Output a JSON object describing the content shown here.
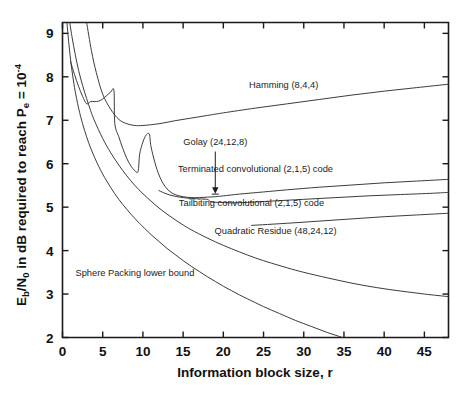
{
  "chart_data": {
    "type": "line",
    "title": "",
    "xlabel": "Information block size, r",
    "ylabel": "Eb/N0 in dB required to reach Pe = 10^-4",
    "ylabel_parts": {
      "p1": "E",
      "sub1": "b",
      "p2": "/N",
      "sub2": "0",
      "p3": " in dB required to reach P",
      "sub3": "e",
      "p4": " = 10",
      "sup1": "-4"
    },
    "xlim": [
      0,
      48
    ],
    "ylim": [
      2,
      9.25
    ],
    "xticks": [
      0,
      5,
      10,
      15,
      20,
      25,
      30,
      35,
      40,
      45
    ],
    "yticks": [
      2,
      3,
      4,
      5,
      6,
      7,
      8,
      9
    ],
    "xticklabels": [
      "0",
      "5",
      "10",
      "15",
      "20",
      "25",
      "30",
      "35",
      "40",
      "45"
    ],
    "yticklabels": [
      "2",
      "3",
      "4",
      "5",
      "6",
      "7",
      "8",
      "9"
    ],
    "grid": false,
    "legend_position": "inline-annotations",
    "line_color": "#33322f",
    "series": [
      {
        "name": "Hamming (8,4,4)",
        "label": "Hamming (8,4,4)",
        "label_xy": [
          27.5,
          7.75
        ],
        "points": [
          [
            3.0,
            9.25
          ],
          [
            3.6,
            8.6
          ],
          [
            4.2,
            8.1
          ],
          [
            5.0,
            7.6
          ],
          [
            6.0,
            7.25
          ],
          [
            7.0,
            7.02
          ],
          [
            8.0,
            6.92
          ],
          [
            9.0,
            6.88
          ],
          [
            10.0,
            6.88
          ],
          [
            12.0,
            6.92
          ],
          [
            14.0,
            6.99
          ],
          [
            16.0,
            7.05
          ],
          [
            18.0,
            7.11
          ],
          [
            20.0,
            7.17
          ],
          [
            24.0,
            7.28
          ],
          [
            28.0,
            7.38
          ],
          [
            32.0,
            7.48
          ],
          [
            36.0,
            7.58
          ],
          [
            40.0,
            7.67
          ],
          [
            44.0,
            7.75
          ],
          [
            48.0,
            7.83
          ]
        ]
      },
      {
        "name": "Terminated convolutional (2,1,5) code",
        "label": "Terminated convolutional (2,1,5) code",
        "label_xy": [
          24.0,
          5.82
        ],
        "points": [
          [
            1.0,
            8.35
          ],
          [
            1.5,
            8.05
          ],
          [
            2.0,
            7.78
          ],
          [
            2.5,
            7.55
          ],
          [
            3.0,
            7.38
          ],
          [
            3.5,
            7.43
          ],
          [
            4.0,
            7.43
          ],
          [
            4.5,
            7.44
          ],
          [
            5.0,
            7.49
          ],
          [
            5.5,
            7.57
          ],
          [
            6.0,
            7.65
          ],
          [
            6.4,
            7.68
          ],
          [
            6.5,
            6.93
          ],
          [
            7.0,
            6.62
          ],
          [
            7.5,
            6.35
          ],
          [
            8.0,
            6.12
          ],
          [
            8.5,
            5.95
          ],
          [
            9.0,
            5.84
          ],
          [
            9.4,
            5.82
          ],
          [
            9.6,
            6.22
          ],
          [
            10.0,
            6.5
          ],
          [
            10.4,
            6.66
          ],
          [
            10.8,
            6.68
          ],
          [
            11.0,
            6.4
          ],
          [
            11.5,
            6.02
          ],
          [
            12.0,
            5.74
          ],
          [
            12.5,
            5.55
          ],
          [
            13.0,
            5.42
          ],
          [
            13.5,
            5.34
          ],
          [
            14.0,
            5.29
          ],
          [
            15.0,
            5.24
          ],
          [
            16.0,
            5.22
          ],
          [
            17.0,
            5.22
          ],
          [
            18.0,
            5.23
          ],
          [
            19.0,
            5.24
          ],
          [
            20.0,
            5.26
          ],
          [
            22.0,
            5.3
          ],
          [
            25.0,
            5.35
          ],
          [
            28.0,
            5.4
          ],
          [
            32.0,
            5.46
          ],
          [
            36.0,
            5.51
          ],
          [
            40.0,
            5.56
          ],
          [
            44.0,
            5.6
          ],
          [
            48.0,
            5.64
          ]
        ]
      },
      {
        "name": "Tailbiting convolutional (2,1,5) code",
        "label": "Tailbiting convolutional (2,1,5) code",
        "label_xy": [
          23.5,
          5.02
        ],
        "points": [
          [
            12.0,
            5.38
          ],
          [
            13.0,
            5.3
          ],
          [
            14.0,
            5.25
          ],
          [
            15.0,
            5.22
          ],
          [
            16.0,
            5.2
          ],
          [
            17.0,
            5.19
          ],
          [
            18.0,
            5.18
          ],
          [
            18.5,
            5.12
          ],
          [
            19.5,
            5.11
          ],
          [
            21.0,
            5.1
          ],
          [
            23.0,
            5.11
          ],
          [
            26.0,
            5.14
          ],
          [
            30.0,
            5.18
          ],
          [
            34.0,
            5.22
          ],
          [
            38.0,
            5.26
          ],
          [
            42.0,
            5.29
          ],
          [
            46.0,
            5.32
          ],
          [
            48.0,
            5.34
          ]
        ]
      },
      {
        "name": "Quadratic Residue (48,24,12)",
        "label": "Quadratic Residue (48,24,12)",
        "label_xy": [
          26.5,
          4.38
        ],
        "points": [
          [
            23.5,
            4.58
          ],
          [
            28.0,
            4.63
          ],
          [
            32.0,
            4.68
          ],
          [
            36.0,
            4.73
          ],
          [
            40.0,
            4.78
          ],
          [
            44.0,
            4.82
          ],
          [
            48.0,
            4.86
          ]
        ]
      },
      {
        "name": "Golay (24,12,8)",
        "label": "Golay (24,12,8)",
        "label_xy": [
          19.0,
          6.42
        ],
        "marker_xy": [
          19.0,
          5.3
        ],
        "arrow_from": [
          19.0,
          6.28
        ],
        "arrow_to": [
          19.0,
          5.38
        ]
      },
      {
        "name": "Sphere Packing lower bound",
        "label": "Sphere Packing lower bound",
        "label_xy": [
          9.0,
          3.42
        ],
        "points": [
          [
            0.9,
            9.25
          ],
          [
            1.2,
            8.9
          ],
          [
            1.6,
            8.5
          ],
          [
            2.0,
            8.15
          ],
          [
            2.5,
            7.8
          ],
          [
            3.0,
            7.5
          ],
          [
            3.5,
            7.22
          ],
          [
            4.0,
            6.98
          ],
          [
            5.0,
            6.58
          ],
          [
            6.0,
            6.25
          ],
          [
            7.0,
            5.97
          ],
          [
            8.0,
            5.72
          ],
          [
            9.0,
            5.5
          ],
          [
            10.0,
            5.31
          ],
          [
            11.0,
            5.14
          ],
          [
            12.0,
            4.98
          ],
          [
            13.0,
            4.84
          ],
          [
            14.0,
            4.71
          ],
          [
            15.0,
            4.59
          ],
          [
            16.0,
            4.48
          ],
          [
            18.0,
            4.29
          ],
          [
            20.0,
            4.12
          ],
          [
            22.0,
            3.97
          ],
          [
            24.0,
            3.83
          ],
          [
            26.0,
            3.71
          ],
          [
            28.0,
            3.6
          ],
          [
            30.0,
            3.5
          ],
          [
            33.0,
            3.37
          ],
          [
            36.0,
            3.25
          ],
          [
            39.0,
            3.15
          ],
          [
            42.0,
            3.07
          ],
          [
            45.0,
            3.0
          ],
          [
            48.0,
            2.94
          ]
        ]
      },
      {
        "name": "Uncoded / upper reference curve",
        "label": "",
        "points": [
          [
            0.55,
            9.25
          ],
          [
            0.8,
            8.75
          ],
          [
            1.1,
            8.25
          ],
          [
            1.5,
            7.75
          ],
          [
            2.0,
            7.28
          ],
          [
            2.5,
            6.92
          ],
          [
            3.0,
            6.62
          ],
          [
            3.5,
            6.36
          ],
          [
            4.0,
            6.14
          ],
          [
            4.5,
            5.94
          ],
          [
            5.0,
            5.76
          ],
          [
            5.5,
            5.6
          ],
          [
            6.0,
            5.45
          ],
          [
            6.5,
            5.31
          ],
          [
            7.0,
            5.18
          ],
          [
            7.5,
            5.06
          ],
          [
            8.0,
            4.95
          ],
          [
            8.5,
            4.84
          ],
          [
            9.0,
            4.74
          ],
          [
            9.5,
            4.64
          ],
          [
            10.0,
            4.55
          ],
          [
            11.0,
            4.37
          ],
          [
            12.0,
            4.21
          ],
          [
            13.0,
            4.05
          ],
          [
            14.0,
            3.91
          ],
          [
            15.0,
            3.77
          ],
          [
            16.0,
            3.64
          ],
          [
            17.0,
            3.52
          ],
          [
            18.0,
            3.4
          ],
          [
            19.0,
            3.29
          ],
          [
            20.0,
            3.18
          ],
          [
            21.0,
            3.08
          ],
          [
            22.0,
            2.98
          ],
          [
            23.0,
            2.89
          ],
          [
            24.0,
            2.8
          ],
          [
            25.0,
            2.71
          ],
          [
            26.0,
            2.63
          ],
          [
            27.0,
            2.55
          ],
          [
            28.0,
            2.47
          ],
          [
            29.0,
            2.39
          ],
          [
            30.0,
            2.32
          ],
          [
            31.0,
            2.25
          ],
          [
            32.0,
            2.18
          ],
          [
            33.0,
            2.11
          ],
          [
            34.0,
            2.05
          ],
          [
            34.8,
            2.0
          ]
        ]
      }
    ]
  }
}
